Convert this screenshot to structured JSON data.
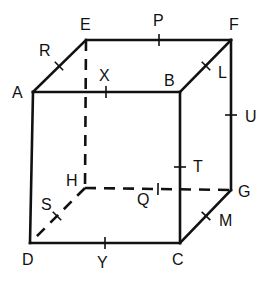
{
  "diagram": {
    "type": "cube",
    "vertices": {
      "A": {
        "label": "A",
        "x": 33,
        "y": 92,
        "lx": 12,
        "ly": 98
      },
      "B": {
        "label": "B",
        "x": 180,
        "y": 92,
        "lx": 164,
        "ly": 86
      },
      "C": {
        "label": "C",
        "x": 180,
        "y": 243,
        "lx": 172,
        "ly": 265
      },
      "D": {
        "label": "D",
        "x": 30,
        "y": 243,
        "lx": 22,
        "ly": 265
      },
      "E": {
        "label": "E",
        "x": 86,
        "y": 40,
        "lx": 80,
        "ly": 30
      },
      "F": {
        "label": "F",
        "x": 231,
        "y": 40,
        "lx": 229,
        "ly": 30
      },
      "G": {
        "label": "G",
        "x": 231,
        "y": 190,
        "lx": 238,
        "ly": 197
      },
      "H": {
        "label": "H",
        "x": 85,
        "y": 188,
        "lx": 66,
        "ly": 186
      }
    },
    "visible_edges": [
      "AB",
      "BC",
      "CD",
      "DA",
      "AE",
      "EF",
      "FB",
      "FG",
      "GC"
    ],
    "hidden_edges": [
      "EH",
      "HG",
      "HD"
    ],
    "midpoints": [
      {
        "label": "R",
        "edge": "AE",
        "x": 59,
        "y": 66,
        "lx": 39,
        "ly": 56
      },
      {
        "label": "P",
        "edge": "EF",
        "x": 159,
        "y": 40,
        "lx": 153,
        "ly": 26
      },
      {
        "label": "X",
        "edge": "AB",
        "x": 106,
        "y": 92,
        "lx": 99,
        "ly": 81
      },
      {
        "label": "L",
        "edge": "BF",
        "x": 206,
        "y": 66,
        "lx": 218,
        "ly": 78
      },
      {
        "label": "U",
        "edge": "FG",
        "x": 231,
        "y": 115,
        "lx": 245,
        "ly": 122
      },
      {
        "label": "T",
        "edge": "BC",
        "x": 180,
        "y": 167,
        "lx": 193,
        "ly": 172
      },
      {
        "label": "Q",
        "edge": "HG",
        "x": 158,
        "y": 189,
        "lx": 137,
        "ly": 205
      },
      {
        "label": "S",
        "edge": "HD",
        "x": 57,
        "y": 216,
        "lx": 41,
        "ly": 210
      },
      {
        "label": "M",
        "edge": "CG",
        "x": 206,
        "y": 216,
        "lx": 219,
        "ly": 226
      },
      {
        "label": "Y",
        "edge": "DC",
        "x": 105,
        "y": 243,
        "lx": 97,
        "ly": 268
      }
    ]
  }
}
